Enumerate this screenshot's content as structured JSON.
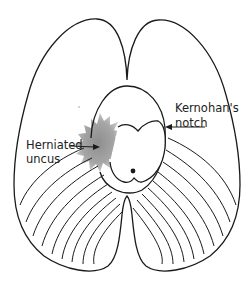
{
  "diagram": {
    "colors": {
      "line": "#1a1a1a",
      "herniation_fill": "#9a9a9a",
      "background": "#ffffff"
    },
    "labels": {
      "kernohan_line1": "Kernohan's",
      "kernohan_line2": "notch",
      "uncus_line1": "Herniated",
      "uncus_line2": "uncus"
    },
    "elements": [
      "cerebral hemispheres outline",
      "tentorial opening",
      "brainstem (midbrain)",
      "herniated uncus (gray shaded region)",
      "cerebellar folia lines",
      "arrow to Kernohan's notch",
      "arrow to herniated uncus"
    ]
  }
}
